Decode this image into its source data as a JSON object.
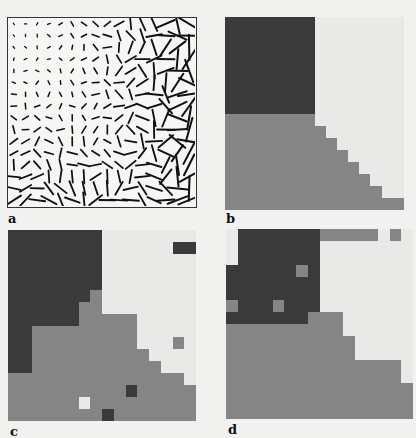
{
  "figure": {
    "labels": {
      "a": "a",
      "b": "b",
      "c": "c",
      "d": "d"
    },
    "colors": {
      "background": "#f1f1ef",
      "light": "#e9e9e7",
      "medium": "#858585",
      "dark": "#3a3a3a",
      "ink": "#111111"
    },
    "panel_a": {
      "description": "Orientation line field on a 16x16 lattice; segment length grows toward right and bottom",
      "rows": 16,
      "cols": 16
    },
    "panel_b": {
      "description": "Ground-truth segmentation, 16x16, 0=light 1=medium 2=dark",
      "grid": [
        [
          2,
          2,
          2,
          2,
          2,
          2,
          2,
          2,
          0,
          0,
          0,
          0,
          0,
          0,
          0,
          0
        ],
        [
          2,
          2,
          2,
          2,
          2,
          2,
          2,
          2,
          0,
          0,
          0,
          0,
          0,
          0,
          0,
          0
        ],
        [
          2,
          2,
          2,
          2,
          2,
          2,
          2,
          2,
          0,
          0,
          0,
          0,
          0,
          0,
          0,
          0
        ],
        [
          2,
          2,
          2,
          2,
          2,
          2,
          2,
          2,
          0,
          0,
          0,
          0,
          0,
          0,
          0,
          0
        ],
        [
          2,
          2,
          2,
          2,
          2,
          2,
          2,
          2,
          0,
          0,
          0,
          0,
          0,
          0,
          0,
          0
        ],
        [
          2,
          2,
          2,
          2,
          2,
          2,
          2,
          2,
          0,
          0,
          0,
          0,
          0,
          0,
          0,
          0
        ],
        [
          2,
          2,
          2,
          2,
          2,
          2,
          2,
          2,
          0,
          0,
          0,
          0,
          0,
          0,
          0,
          0
        ],
        [
          2,
          2,
          2,
          2,
          2,
          2,
          2,
          2,
          0,
          0,
          0,
          0,
          0,
          0,
          0,
          0
        ],
        [
          1,
          1,
          1,
          1,
          1,
          1,
          1,
          1,
          0,
          0,
          0,
          0,
          0,
          0,
          0,
          0
        ],
        [
          1,
          1,
          1,
          1,
          1,
          1,
          1,
          1,
          1,
          0,
          0,
          0,
          0,
          0,
          0,
          0
        ],
        [
          1,
          1,
          1,
          1,
          1,
          1,
          1,
          1,
          1,
          1,
          0,
          0,
          0,
          0,
          0,
          0
        ],
        [
          1,
          1,
          1,
          1,
          1,
          1,
          1,
          1,
          1,
          1,
          1,
          0,
          0,
          0,
          0,
          0
        ],
        [
          1,
          1,
          1,
          1,
          1,
          1,
          1,
          1,
          1,
          1,
          1,
          1,
          0,
          0,
          0,
          0
        ],
        [
          1,
          1,
          1,
          1,
          1,
          1,
          1,
          1,
          1,
          1,
          1,
          1,
          1,
          0,
          0,
          0
        ],
        [
          1,
          1,
          1,
          1,
          1,
          1,
          1,
          1,
          1,
          1,
          1,
          1,
          1,
          1,
          0,
          0
        ],
        [
          1,
          1,
          1,
          1,
          1,
          1,
          1,
          1,
          1,
          1,
          1,
          1,
          1,
          1,
          1,
          1
        ]
      ]
    },
    "panel_c": {
      "description": "Segmentation result, 16x16",
      "grid": [
        [
          2,
          2,
          2,
          2,
          2,
          2,
          2,
          2,
          0,
          0,
          0,
          0,
          0,
          0,
          0,
          0
        ],
        [
          2,
          2,
          2,
          2,
          2,
          2,
          2,
          2,
          0,
          0,
          0,
          0,
          0,
          0,
          2,
          2
        ],
        [
          2,
          2,
          2,
          2,
          2,
          2,
          2,
          2,
          0,
          0,
          0,
          0,
          0,
          0,
          0,
          0
        ],
        [
          2,
          2,
          2,
          2,
          2,
          2,
          2,
          2,
          0,
          0,
          0,
          0,
          0,
          0,
          0,
          0
        ],
        [
          2,
          2,
          2,
          2,
          2,
          2,
          2,
          2,
          0,
          0,
          0,
          0,
          0,
          0,
          0,
          0
        ],
        [
          2,
          2,
          2,
          2,
          2,
          2,
          2,
          1,
          0,
          0,
          0,
          0,
          0,
          0,
          0,
          0
        ],
        [
          2,
          2,
          2,
          2,
          2,
          2,
          1,
          1,
          0,
          0,
          0,
          0,
          0,
          0,
          0,
          0
        ],
        [
          2,
          2,
          2,
          2,
          2,
          2,
          1,
          1,
          1,
          1,
          1,
          0,
          0,
          0,
          0,
          0
        ],
        [
          2,
          2,
          1,
          1,
          1,
          1,
          1,
          1,
          1,
          1,
          1,
          0,
          0,
          0,
          0,
          0
        ],
        [
          2,
          2,
          1,
          1,
          1,
          1,
          1,
          1,
          1,
          1,
          1,
          0,
          0,
          0,
          1,
          0
        ],
        [
          2,
          2,
          1,
          1,
          1,
          1,
          1,
          1,
          1,
          1,
          1,
          1,
          0,
          0,
          0,
          0
        ],
        [
          2,
          2,
          1,
          1,
          1,
          1,
          1,
          1,
          1,
          1,
          1,
          1,
          1,
          0,
          0,
          0
        ],
        [
          1,
          1,
          1,
          1,
          1,
          1,
          1,
          1,
          1,
          1,
          1,
          1,
          1,
          1,
          1,
          0
        ],
        [
          1,
          1,
          1,
          1,
          1,
          1,
          1,
          1,
          1,
          1,
          2,
          1,
          1,
          1,
          1,
          1
        ],
        [
          1,
          1,
          1,
          1,
          1,
          1,
          0,
          1,
          1,
          1,
          1,
          1,
          1,
          1,
          1,
          1
        ],
        [
          1,
          1,
          1,
          1,
          1,
          1,
          1,
          1,
          2,
          1,
          1,
          1,
          1,
          1,
          1,
          1
        ]
      ]
    },
    "panel_d": {
      "description": "Segmentation result, 16x16",
      "grid": [
        [
          0,
          2,
          2,
          2,
          2,
          2,
          2,
          2,
          1,
          1,
          1,
          1,
          1,
          0,
          1,
          0
        ],
        [
          0,
          2,
          2,
          2,
          2,
          2,
          2,
          2,
          0,
          0,
          0,
          0,
          0,
          0,
          0,
          0
        ],
        [
          0,
          2,
          2,
          2,
          2,
          2,
          2,
          2,
          0,
          0,
          0,
          0,
          0,
          0,
          0,
          0
        ],
        [
          2,
          2,
          2,
          2,
          2,
          2,
          1,
          2,
          0,
          0,
          0,
          0,
          0,
          0,
          0,
          0
        ],
        [
          2,
          2,
          2,
          2,
          2,
          2,
          2,
          2,
          0,
          0,
          0,
          0,
          0,
          0,
          0,
          0
        ],
        [
          2,
          2,
          2,
          2,
          2,
          2,
          2,
          2,
          0,
          0,
          0,
          0,
          0,
          0,
          0,
          0
        ],
        [
          1,
          2,
          2,
          2,
          1,
          2,
          2,
          2,
          0,
          0,
          0,
          0,
          0,
          0,
          0,
          0
        ],
        [
          2,
          2,
          2,
          2,
          2,
          2,
          2,
          1,
          1,
          1,
          0,
          0,
          0,
          0,
          0,
          0
        ],
        [
          1,
          1,
          1,
          1,
          1,
          1,
          1,
          1,
          1,
          1,
          0,
          0,
          0,
          0,
          0,
          0
        ],
        [
          1,
          1,
          1,
          1,
          1,
          1,
          1,
          1,
          1,
          1,
          1,
          0,
          0,
          0,
          0,
          0
        ],
        [
          1,
          1,
          1,
          1,
          1,
          1,
          1,
          1,
          1,
          1,
          1,
          0,
          0,
          0,
          0,
          0
        ],
        [
          1,
          1,
          1,
          1,
          1,
          1,
          1,
          1,
          1,
          1,
          1,
          1,
          1,
          1,
          1,
          0
        ],
        [
          1,
          1,
          1,
          1,
          1,
          1,
          1,
          1,
          1,
          1,
          1,
          1,
          1,
          1,
          1,
          0
        ],
        [
          1,
          1,
          1,
          1,
          1,
          1,
          1,
          1,
          1,
          1,
          1,
          1,
          1,
          1,
          1,
          1
        ],
        [
          1,
          1,
          1,
          1,
          1,
          1,
          1,
          1,
          1,
          1,
          1,
          1,
          1,
          1,
          1,
          1
        ],
        [
          1,
          1,
          1,
          1,
          1,
          1,
          1,
          1,
          1,
          1,
          1,
          1,
          1,
          1,
          1,
          1
        ]
      ]
    }
  }
}
